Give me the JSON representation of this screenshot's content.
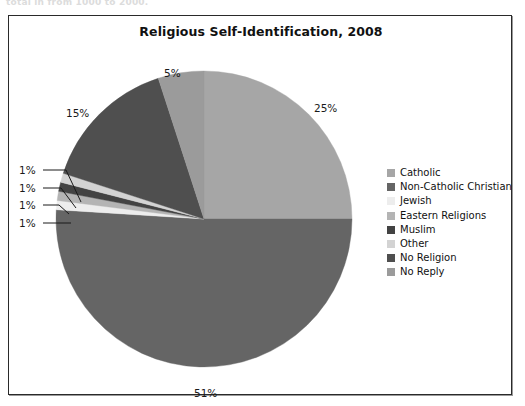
{
  "caption": {
    "text": "total in from 1000 to 2000."
  },
  "chart_frame": {
    "title": "Religious Self-Identification, 2008"
  },
  "legend": {
    "position": "right",
    "items": [
      {
        "label": "Catholic",
        "color": "#a6a6a6"
      },
      {
        "label": "Non-Catholic Christian",
        "color": "#656565"
      },
      {
        "label": "Jewish",
        "color": "#ededed"
      },
      {
        "label": "Eastern Religions",
        "color": "#b4b4b4"
      },
      {
        "label": "Muslim",
        "color": "#434343"
      },
      {
        "label": "Other",
        "color": "#d3d3d3"
      },
      {
        "label": "No Religion",
        "color": "#4f4f4f"
      },
      {
        "label": "No Reply",
        "color": "#9b9b9b"
      }
    ]
  },
  "chart_data": {
    "type": "pie",
    "title": "Religious Self-Identification, 2008",
    "xlabel": "",
    "ylabel": "",
    "start_angle_deg": 0,
    "direction": "clockwise",
    "categories": [
      "Catholic",
      "Non-Catholic Christian",
      "Jewish",
      "Eastern Religions",
      "Muslim",
      "Other",
      "No Religion",
      "No Reply"
    ],
    "values": [
      25,
      51,
      1,
      1,
      1,
      1,
      15,
      5
    ],
    "colors": [
      "#a6a6a6",
      "#656565",
      "#ededed",
      "#b4b4b4",
      "#434343",
      "#d3d3d3",
      "#4f4f4f",
      "#9b9b9b"
    ],
    "data_labels": [
      "25%",
      "51%",
      "1%",
      "1%",
      "1%",
      "1%",
      "15%",
      "5%"
    ],
    "units": "percent",
    "legend_position": "right",
    "grid": false
  },
  "slice_labels": [
    {
      "text": "25%",
      "left": 305,
      "top": 86,
      "leader": false
    },
    {
      "text": "51%",
      "left": 185,
      "top": 371,
      "leader": false
    },
    {
      "text": "15%",
      "left": 57,
      "top": 91,
      "leader": false
    },
    {
      "text": "5%",
      "left": 155,
      "top": 51,
      "leader": false
    },
    {
      "text": "1%",
      "left": 10,
      "top": 148,
      "leader": true
    },
    {
      "text": "1%",
      "left": 10,
      "top": 166,
      "leader": true
    },
    {
      "text": "1%",
      "left": 10,
      "top": 183,
      "leader": true
    },
    {
      "text": "1%",
      "left": 10,
      "top": 201,
      "leader": true
    }
  ]
}
